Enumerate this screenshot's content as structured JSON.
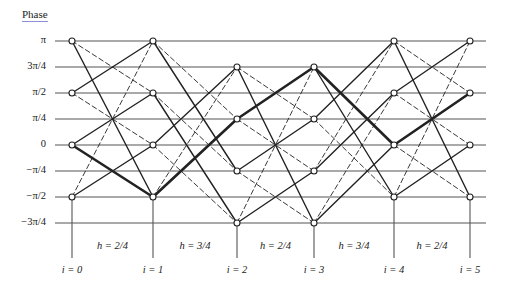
{
  "axis": {
    "title": "Phase",
    "underline_color": "#8a8fd8",
    "levels": [
      {
        "label": "π",
        "value": 4,
        "y": 41
      },
      {
        "label": "3π/4",
        "value": 3,
        "y": 67
      },
      {
        "label": "π/2",
        "value": 2,
        "y": 93
      },
      {
        "label": "π/4",
        "value": 1,
        "y": 119
      },
      {
        "label": "0",
        "value": 0,
        "y": 145
      },
      {
        "label": "−π/4",
        "value": -1,
        "y": 171
      },
      {
        "label": "−π/2",
        "value": -2,
        "y": 197
      },
      {
        "label": "−3π/4",
        "value": -3,
        "y": 223
      }
    ],
    "line_x_start": 55,
    "line_x_end": 486
  },
  "stages": [
    {
      "label": "i = 0",
      "x": 72,
      "nodes": [
        4,
        2,
        0,
        -2
      ]
    },
    {
      "label": "i = 1",
      "x": 153,
      "nodes": [
        4,
        2,
        0,
        -2
      ]
    },
    {
      "label": "i = 2",
      "x": 237,
      "nodes": [
        3,
        1,
        -1,
        -3
      ]
    },
    {
      "label": "i = 3",
      "x": 314,
      "nodes": [
        3,
        1,
        -1,
        -3
      ]
    },
    {
      "label": "i = 4",
      "x": 394,
      "nodes": [
        4,
        2,
        0,
        -2
      ]
    },
    {
      "label": "i = 5",
      "x": 470,
      "nodes": [
        4,
        2,
        0,
        -2
      ]
    }
  ],
  "intervals": [
    {
      "label": "h = 2/4",
      "step": 2
    },
    {
      "label": "h = 3/4",
      "step": 3
    },
    {
      "label": "h = 2/4",
      "step": 2
    },
    {
      "label": "h = 3/4",
      "step": 3
    },
    {
      "label": "h = 2/4",
      "step": 2
    }
  ],
  "edges": [
    {
      "from": [
        0,
        4
      ],
      "to": [
        1,
        -2
      ],
      "style": "solid"
    },
    {
      "from": [
        0,
        4
      ],
      "to": [
        1,
        2
      ],
      "style": "dashed"
    },
    {
      "from": [
        0,
        2
      ],
      "to": [
        1,
        4
      ],
      "style": "solid"
    },
    {
      "from": [
        0,
        2
      ],
      "to": [
        1,
        0
      ],
      "style": "dashed"
    },
    {
      "from": [
        0,
        0
      ],
      "to": [
        1,
        2
      ],
      "style": "solid"
    },
    {
      "from": [
        0,
        0
      ],
      "to": [
        1,
        -2
      ],
      "style": "thick"
    },
    {
      "from": [
        0,
        -2
      ],
      "to": [
        1,
        0
      ],
      "style": "solid"
    },
    {
      "from": [
        0,
        -2
      ],
      "to": [
        1,
        4
      ],
      "style": "dashed"
    },
    {
      "from": [
        1,
        4
      ],
      "to": [
        2,
        -1
      ],
      "style": "solid"
    },
    {
      "from": [
        1,
        4
      ],
      "to": [
        2,
        1
      ],
      "style": "dashed"
    },
    {
      "from": [
        1,
        2
      ],
      "to": [
        2,
        -3
      ],
      "style": "solid"
    },
    {
      "from": [
        1,
        2
      ],
      "to": [
        2,
        -1
      ],
      "style": "dashed"
    },
    {
      "from": [
        1,
        0
      ],
      "to": [
        2,
        3
      ],
      "style": "solid"
    },
    {
      "from": [
        1,
        0
      ],
      "to": [
        2,
        -3
      ],
      "style": "dashed"
    },
    {
      "from": [
        1,
        -2
      ],
      "to": [
        2,
        1
      ],
      "style": "thick"
    },
    {
      "from": [
        1,
        -2
      ],
      "to": [
        2,
        3
      ],
      "style": "dashed"
    },
    {
      "from": [
        2,
        3
      ],
      "to": [
        3,
        -3
      ],
      "style": "solid"
    },
    {
      "from": [
        2,
        3
      ],
      "to": [
        3,
        1
      ],
      "style": "dashed"
    },
    {
      "from": [
        2,
        1
      ],
      "to": [
        3,
        3
      ],
      "style": "thick"
    },
    {
      "from": [
        2,
        1
      ],
      "to": [
        3,
        -1
      ],
      "style": "dashed"
    },
    {
      "from": [
        2,
        -1
      ],
      "to": [
        3,
        1
      ],
      "style": "solid"
    },
    {
      "from": [
        2,
        -1
      ],
      "to": [
        3,
        -3
      ],
      "style": "dashed"
    },
    {
      "from": [
        2,
        -3
      ],
      "to": [
        3,
        -1
      ],
      "style": "solid"
    },
    {
      "from": [
        2,
        -3
      ],
      "to": [
        3,
        3
      ],
      "style": "dashed"
    },
    {
      "from": [
        3,
        3
      ],
      "to": [
        4,
        -2
      ],
      "style": "solid"
    },
    {
      "from": [
        3,
        3
      ],
      "to": [
        4,
        0
      ],
      "style": "thick"
    },
    {
      "from": [
        3,
        1
      ],
      "to": [
        4,
        4
      ],
      "style": "solid"
    },
    {
      "from": [
        3,
        1
      ],
      "to": [
        4,
        -2
      ],
      "style": "dashed"
    },
    {
      "from": [
        3,
        -1
      ],
      "to": [
        4,
        2
      ],
      "style": "solid"
    },
    {
      "from": [
        3,
        -1
      ],
      "to": [
        4,
        4
      ],
      "style": "dashed"
    },
    {
      "from": [
        3,
        -3
      ],
      "to": [
        4,
        0
      ],
      "style": "solid"
    },
    {
      "from": [
        3,
        -3
      ],
      "to": [
        4,
        2
      ],
      "style": "dashed"
    },
    {
      "from": [
        4,
        4
      ],
      "to": [
        5,
        -2
      ],
      "style": "solid"
    },
    {
      "from": [
        4,
        4
      ],
      "to": [
        5,
        2
      ],
      "style": "dashed"
    },
    {
      "from": [
        4,
        2
      ],
      "to": [
        5,
        4
      ],
      "style": "solid"
    },
    {
      "from": [
        4,
        2
      ],
      "to": [
        5,
        0
      ],
      "style": "dashed"
    },
    {
      "from": [
        4,
        0
      ],
      "to": [
        5,
        2
      ],
      "style": "thick"
    },
    {
      "from": [
        4,
        0
      ],
      "to": [
        5,
        -2
      ],
      "style": "dashed"
    },
    {
      "from": [
        4,
        -2
      ],
      "to": [
        5,
        0
      ],
      "style": "solid"
    },
    {
      "from": [
        4,
        -2
      ],
      "to": [
        5,
        4
      ],
      "style": "dashed"
    }
  ],
  "highlighted_path": [
    "0",
    "−π/2",
    "π/4",
    "3π/4",
    "0",
    "π/2"
  ],
  "layout": {
    "stem_bottom_y": 258,
    "h_label_y": 240,
    "i_label_y": 264,
    "line_color": "#555555",
    "edge_color": "#222222"
  }
}
